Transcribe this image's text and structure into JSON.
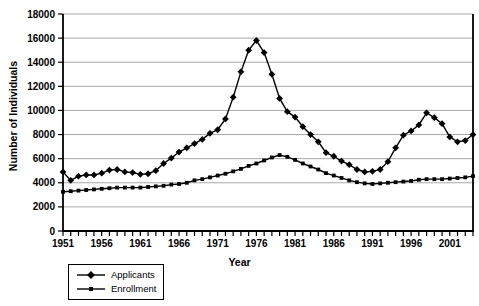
{
  "chart_data": {
    "type": "line",
    "title": "",
    "xlabel": "Year",
    "ylabel": "Number of Individuals",
    "x_start": 1951,
    "x_end": 2004,
    "x_tick_labels": [
      1951,
      1956,
      1961,
      1966,
      1971,
      1976,
      1981,
      1986,
      1991,
      1996,
      2001
    ],
    "ylim": [
      0,
      18000
    ],
    "y_tick_step": 2000,
    "grid": "horizontal",
    "legend_position": "bottom-left",
    "series": [
      {
        "name": "Applicants",
        "marker": "diamond",
        "values": [
          4900,
          4200,
          4550,
          4650,
          4650,
          4800,
          5050,
          5100,
          4900,
          4850,
          4700,
          4750,
          5000,
          5600,
          6050,
          6550,
          6900,
          7250,
          7600,
          8100,
          8400,
          9300,
          11100,
          13200,
          15000,
          15800,
          14800,
          13000,
          11000,
          9900,
          9450,
          8650,
          8000,
          7400,
          6500,
          6200,
          5800,
          5500,
          5100,
          4900,
          4950,
          5100,
          5750,
          6900,
          7950,
          8300,
          8800,
          9800,
          9400,
          8900,
          7800,
          7400,
          7500,
          8000
        ]
      },
      {
        "name": "Enrollment",
        "marker": "square",
        "values": [
          3250,
          3300,
          3350,
          3400,
          3450,
          3500,
          3550,
          3600,
          3600,
          3600,
          3600,
          3650,
          3700,
          3750,
          3850,
          3900,
          4000,
          4200,
          4300,
          4450,
          4600,
          4750,
          4950,
          5150,
          5400,
          5600,
          5850,
          6100,
          6300,
          6150,
          5900,
          5600,
          5350,
          5100,
          4800,
          4600,
          4400,
          4200,
          4050,
          3950,
          3900,
          3950,
          4000,
          4050,
          4100,
          4150,
          4250,
          4300,
          4300,
          4300,
          4350,
          4400,
          4450,
          4550
        ]
      }
    ]
  },
  "colors": {
    "line": "#000000",
    "grid": "#a8a8a8",
    "background": "#ffffff",
    "text": "#000000"
  }
}
